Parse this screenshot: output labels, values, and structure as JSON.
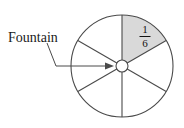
{
  "figure": {
    "type": "sector-diagram",
    "caption_label": "Fountain",
    "fraction": {
      "numerator": "1",
      "denominator": "6",
      "display": "1/6"
    },
    "geometry": {
      "circle_center_x": 122,
      "circle_center_y": 66,
      "circle_radius": 51,
      "hub_radius": 6,
      "sector_count": 6,
      "shaded_sector_index": 1,
      "shaded_start_angle_deg": -90,
      "shaded_end_angle_deg": -30,
      "spoke_angles_deg": [
        -90,
        -30,
        30,
        90,
        150,
        210
      ],
      "arrow_tip_x": 114,
      "arrow_tip_y": 66,
      "leader_start_x": 47,
      "leader_start_y": 43,
      "leader_elbow_x": 56,
      "leader_elbow_y": 66
    },
    "colors": {
      "stroke": "#4a4a4a",
      "shaded_fill": "#d9d9d9",
      "background": "#ffffff",
      "text": "#1a1a1a"
    }
  }
}
